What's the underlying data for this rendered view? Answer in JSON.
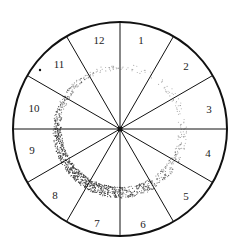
{
  "diagram": {
    "type": "radial-sector-wheel",
    "center": [
      120,
      129
    ],
    "radius": 107,
    "sector_count": 12,
    "sectors": [
      {
        "label": "12",
        "pos": [
          99,
          44
        ]
      },
      {
        "label": "1",
        "pos": [
          141,
          44
        ]
      },
      {
        "label": "2",
        "pos": [
          186,
          70
        ]
      },
      {
        "label": "3",
        "pos": [
          209,
          113
        ]
      },
      {
        "label": "4",
        "pos": [
          208,
          157
        ]
      },
      {
        "label": "5",
        "pos": [
          186,
          200
        ]
      },
      {
        "label": "6",
        "pos": [
          143,
          228
        ]
      },
      {
        "label": "7",
        "pos": [
          97,
          227
        ]
      },
      {
        "label": "8",
        "pos": [
          55,
          199
        ]
      },
      {
        "label": "9",
        "pos": [
          32,
          154
        ]
      },
      {
        "label": "10",
        "pos": [
          34,
          112
        ]
      },
      {
        "label": "11",
        "pos": [
          59,
          68
        ]
      }
    ],
    "ring": {
      "description": "stippled annulus, densest in sectors 7-9, fading toward top",
      "outer_radius": 67,
      "inner_radius": 56,
      "color": "#333333"
    },
    "marker_dot": [
      40,
      70
    ],
    "line_color": "#111111"
  }
}
